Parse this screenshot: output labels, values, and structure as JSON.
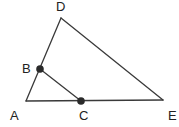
{
  "diagram": {
    "type": "geometry-triangle",
    "stroke_color": "#3a3a3a",
    "point_color": "#2a2a2a",
    "vertices": {
      "A": {
        "x": 26,
        "y": 101,
        "label": "A",
        "label_x": 10,
        "label_y": 120
      },
      "D": {
        "x": 61,
        "y": 18,
        "label": "D",
        "label_x": 56,
        "label_y": 11
      },
      "E": {
        "x": 163,
        "y": 100,
        "label": "E",
        "label_x": 168,
        "label_y": 120
      }
    },
    "points": {
      "B": {
        "x": 40,
        "y": 69,
        "label": "B",
        "label_x": 22,
        "label_y": 73,
        "on_segment": "AD"
      },
      "C": {
        "x": 81,
        "y": 101,
        "label": "C",
        "label_x": 79,
        "label_y": 120,
        "on_segment": "AE"
      }
    },
    "segments": [
      {
        "name": "AD",
        "from": "A",
        "to": "D"
      },
      {
        "name": "DE",
        "from": "D",
        "to": "E"
      },
      {
        "name": "AE",
        "from": "A",
        "to": "E"
      },
      {
        "name": "BC",
        "from": "B",
        "to": "C"
      }
    ]
  }
}
